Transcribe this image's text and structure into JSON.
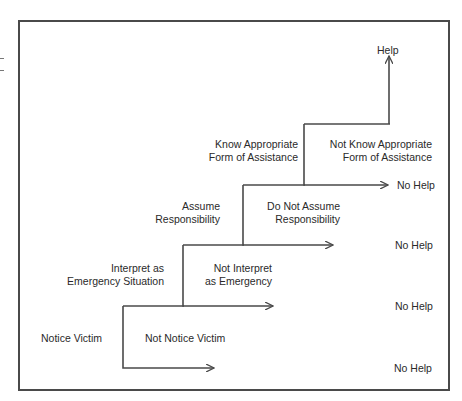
{
  "diagram": {
    "type": "decision-staircase",
    "outcome_help": "Help",
    "steps": [
      {
        "yes_line1": "Notice Victim",
        "yes_line2": "",
        "no_line1": "Not Notice Victim",
        "no_line2": "",
        "no_outcome": "No Help"
      },
      {
        "yes_line1": "Interpret as",
        "yes_line2": "Emergency Situation",
        "no_line1": "Not Interpret",
        "no_line2": "as Emergency",
        "no_outcome": "No Help"
      },
      {
        "yes_line1": "Assume",
        "yes_line2": "Responsibility",
        "no_line1": "Do Not Assume",
        "no_line2": "Responsibility",
        "no_outcome": "No Help"
      },
      {
        "yes_line1": "Know Appropriate",
        "yes_line2": "Form of Assistance",
        "no_line1": "Not Know Appropriate",
        "no_line2": "Form of Assistance",
        "no_outcome": "No Help"
      }
    ],
    "colors": {
      "line": "#4a4a4a",
      "text": "#2a2a2a",
      "background": "#ffffff"
    }
  }
}
